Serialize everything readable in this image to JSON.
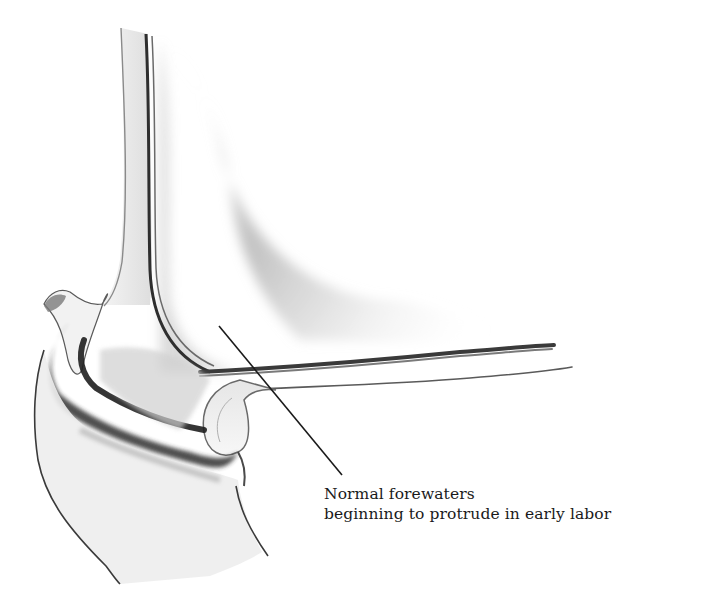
{
  "illustration": {
    "subject": "Cross-section of uterine wall and cervix with amniotic membranes",
    "colors": {
      "background": "#ffffff",
      "ink": "#1a1a1a",
      "shade_light": "#d8d8d8",
      "shade_mid": "#a8a8a8",
      "shade_dark": "#2e2e2e"
    }
  },
  "label": {
    "line1": "Normal forewaters",
    "line2": "beginning to protrude in early labor",
    "leader": {
      "x1": 219,
      "y1": 326,
      "x2": 342,
      "y2": 475
    }
  }
}
